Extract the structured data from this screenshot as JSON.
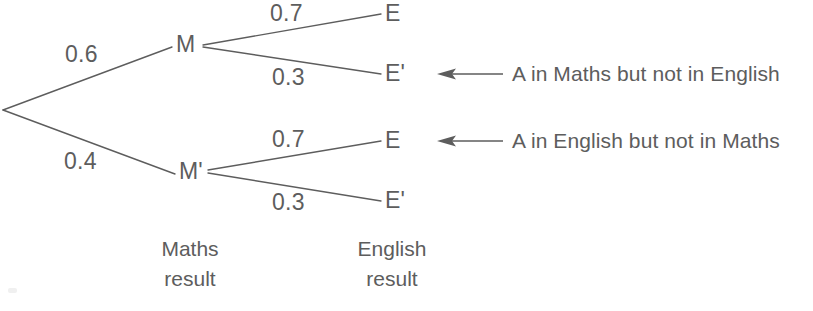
{
  "diagram": {
    "stroke_color": "#5d5d5d",
    "text_color": "#5d5d5d",
    "background_color": "#ffffff",
    "root": {
      "label": "",
      "x": 3,
      "y": 110
    },
    "nodes": [
      {
        "id": "M",
        "label": "M",
        "x": 185,
        "y": 45,
        "stage": "maths"
      },
      {
        "id": "Mp",
        "label": "M'",
        "x": 188,
        "y": 172,
        "stage": "maths"
      },
      {
        "id": "E1",
        "label": "E",
        "x": 390,
        "y": 13,
        "stage": "english"
      },
      {
        "id": "Ep1",
        "label": "E'",
        "x": 390,
        "y": 73,
        "stage": "english"
      },
      {
        "id": "E2",
        "label": "E",
        "x": 390,
        "y": 140,
        "stage": "english"
      },
      {
        "id": "Ep2",
        "label": "E'",
        "x": 390,
        "y": 200,
        "stage": "english"
      }
    ],
    "branches": [
      {
        "from": "root",
        "to": "M",
        "probability": "0.6",
        "label_x": 65,
        "label_y": 43
      },
      {
        "from": "root",
        "to": "Mp",
        "probability": "0.4",
        "label_x": 64,
        "label_y": 150
      },
      {
        "from": "M",
        "to": "E1",
        "probability": "0.7",
        "label_x": 270,
        "label_y": 2
      },
      {
        "from": "M",
        "to": "Ep1",
        "probability": "0.3",
        "label_x": 272,
        "label_y": 66
      },
      {
        "from": "Mp",
        "to": "E2",
        "probability": "0.7",
        "label_x": 272,
        "label_y": 128
      },
      {
        "from": "Mp",
        "to": "Ep2",
        "probability": "0.3",
        "label_x": 272,
        "label_y": 191
      }
    ],
    "stage_captions": [
      {
        "id": "maths-caption",
        "line1": "Maths",
        "line2": "result",
        "x": 190,
        "y": 237
      },
      {
        "id": "english-caption",
        "line1": "English",
        "line2": "result",
        "x": 392,
        "y": 237
      }
    ],
    "annotations": [
      {
        "id": "annotation-maths-not-english",
        "text": "A in Maths but not in English",
        "points_to": "Ep1",
        "arrow_x1": 503,
        "arrow_x2": 437,
        "arrow_y": 74,
        "text_x": 512,
        "text_y": 63
      },
      {
        "id": "annotation-english-not-maths",
        "text": "A in English but not in Maths",
        "points_to": "E2",
        "arrow_x1": 503,
        "arrow_x2": 437,
        "arrow_y": 141,
        "text_x": 512,
        "text_y": 130
      }
    ]
  }
}
